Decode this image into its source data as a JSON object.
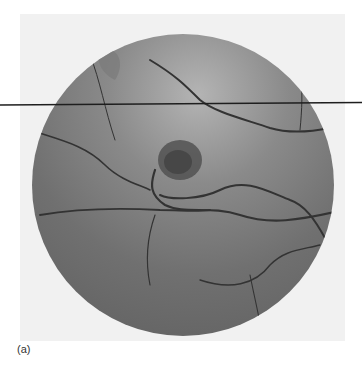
{
  "figure": {
    "panel_label": "(a)",
    "background_color": "#f2f2f2",
    "fundus_color": "#6e6e6e",
    "vessel_color": "#2e2e2e",
    "overlay_line_color": "#1e1e1e"
  }
}
